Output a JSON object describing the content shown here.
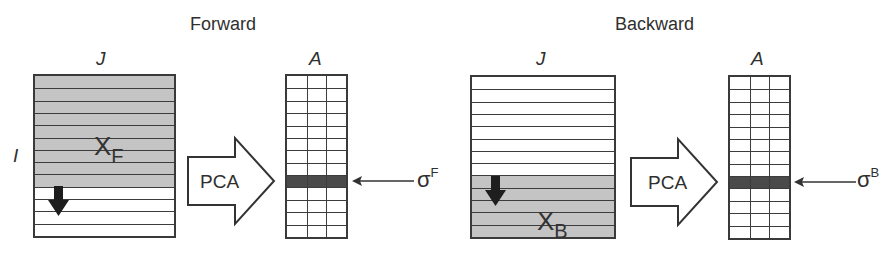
{
  "panels": [
    {
      "id": "forward",
      "title": "Forward",
      "matrix": {
        "column_label": "J",
        "row_label": "I",
        "data_label": "X",
        "data_subscript": "F",
        "rows": 13,
        "shaded_rows": [
          0,
          1,
          2,
          3,
          4,
          5,
          6,
          7,
          8
        ],
        "shade_color": "#c4c4c4",
        "direction_arrow": "down"
      },
      "transform_label": "PCA",
      "result": {
        "column_label": "A",
        "rows": 13,
        "cols": 3,
        "highlighted_row": 8,
        "highlight_color": "#4a4a4a"
      },
      "pointer_label": "σ",
      "pointer_superscript": "F"
    },
    {
      "id": "backward",
      "title": "Backward",
      "matrix": {
        "column_label": "J",
        "row_label": "",
        "data_label": "X",
        "data_subscript": "B",
        "rows": 13,
        "shaded_rows": [
          8,
          9,
          10,
          11,
          12
        ],
        "shade_color": "#c4c4c4",
        "direction_arrow": "down"
      },
      "transform_label": "PCA",
      "result": {
        "column_label": "A",
        "rows": 13,
        "cols": 3,
        "highlighted_row": 8,
        "highlight_color": "#4a4a4a"
      },
      "pointer_label": "σ",
      "pointer_superscript": "B"
    }
  ]
}
